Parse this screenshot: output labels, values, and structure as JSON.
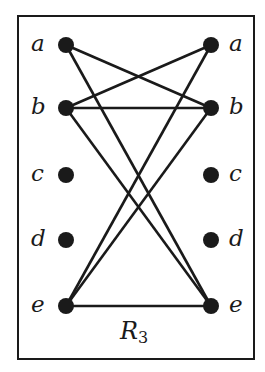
{
  "diagram": {
    "title": "R",
    "title_subscript": "3",
    "left_nodes": [
      "a",
      "b",
      "c",
      "d",
      "e"
    ],
    "right_nodes": [
      "a",
      "b",
      "c",
      "d",
      "e"
    ],
    "edges": [
      [
        "a",
        "b"
      ],
      [
        "a",
        "e"
      ],
      [
        "b",
        "a"
      ],
      [
        "b",
        "b"
      ],
      [
        "b",
        "e"
      ],
      [
        "e",
        "a"
      ],
      [
        "e",
        "b"
      ],
      [
        "e",
        "e"
      ]
    ],
    "colors": {
      "ink": "#1a1a1a",
      "background": "#ffffff"
    }
  }
}
